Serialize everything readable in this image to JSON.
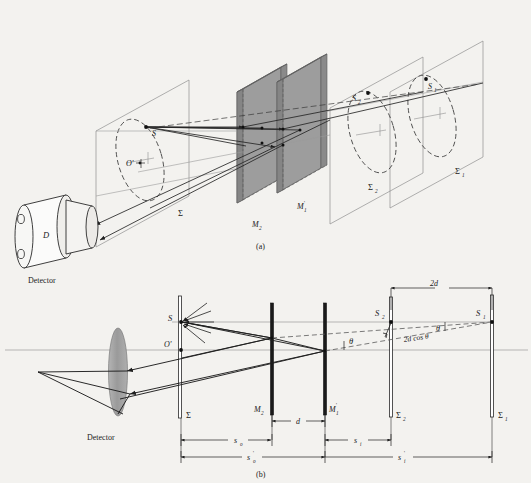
{
  "figure": {
    "captions": {
      "a": "(a)",
      "b": "(b)"
    },
    "colors": {
      "background": "#f3f2ef",
      "ink": "#1a1a1a",
      "mirror_face": "#9a9a9a",
      "mirror_edge": "#6e6e6e",
      "lens_fill": "#9d9d9d",
      "plane_line": "#8d8d8d",
      "ray": "#2a2a2a",
      "dashed": "#3a3a3a"
    }
  },
  "panel_a": {
    "caption": "(a)",
    "labels": {
      "source_point": "S",
      "origin_point": "O'",
      "image_2": "S",
      "image_2_sub": "2",
      "image_1": "S",
      "image_1_sub": "1",
      "mirror_2": "M",
      "mirror_2_sub": "2",
      "mirror_1": "M",
      "mirror_1_sub": "1",
      "mirror_1_prime": "'",
      "plane_sigma": "Σ",
      "plane_sigma_2": "Σ",
      "plane_sigma_2_sub": "2",
      "plane_sigma_1": "Σ",
      "plane_sigma_1_sub": "1",
      "detector_body": "D",
      "detector_name": "Detector"
    }
  },
  "panel_b": {
    "caption": "(b)",
    "labels": {
      "source_point": "S",
      "origin_point": "O'",
      "image_2": "S",
      "image_2_sub": "2",
      "image_1": "S",
      "image_1_sub": "1",
      "mirror_2": "M",
      "mirror_2_sub": "2",
      "mirror_1": "M",
      "mirror_1_sub": "1",
      "mirror_1_prime": "'",
      "plane_sigma": "Σ",
      "plane_sigma_2": "Σ",
      "plane_sigma_2_sub": "2",
      "plane_sigma_1": "Σ",
      "plane_sigma_1_sub": "1",
      "detector_name": "Detector",
      "angle_theta_upper": "θ",
      "angle_theta_lower": "θ"
    },
    "dimensions": {
      "separation_2d": "2d",
      "path_difference": "2d cos θ",
      "mirror_gap": "d",
      "object_distance": "s",
      "object_distance_sub": "o",
      "object_distance_prime": "s",
      "object_distance_prime_sub": "o",
      "image_distance": "s",
      "image_distance_sub": "i",
      "image_distance_prime": "s",
      "image_distance_prime_sub": "i"
    }
  }
}
